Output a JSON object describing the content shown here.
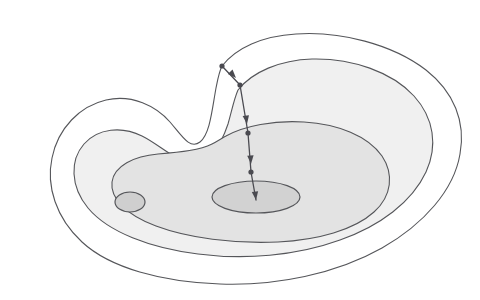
{
  "figure": {
    "name": "contour-descent-diagram",
    "width": 480,
    "height": 300,
    "background": "#ffffff",
    "style": "hand-drawn pencil sketch"
  },
  "colors": {
    "background": "#ffffff",
    "stroke": "#55565a",
    "band_1_fill": "#ffffff",
    "band_2_fill": "#f0f0f0",
    "band_3_fill": "#e3e3e3",
    "band_4_fill": "#d2d2d2",
    "minor_basin_fill": "#cfcfcf",
    "trajectory": "#4a4a50"
  },
  "contours": [
    {
      "name": "contour-level-1-outer",
      "label": "outermost level set",
      "fill": "#ffffff",
      "stroke": "#55565a",
      "stroke_width": 1.1,
      "path": "M 222 66 C 236 48 262 36 296 34 C 340 31 392 44 426 70 C 454 92 466 122 460 154 C 454 190 424 224 382 248 C 336 274 276 286 220 284 C 162 282 110 268 82 242 C 56 218 46 186 52 158 C 58 128 80 106 106 100 C 132 94 156 106 170 122 C 182 136 190 150 200 142 C 210 134 212 110 216 88 C 218 78 219 72 222 66 Z"
    },
    {
      "name": "contour-level-2",
      "label": "second level set",
      "fill": "#f0f0f0",
      "stroke": "#55565a",
      "stroke_width": 1.1,
      "path": "M 238 90 C 252 72 280 60 312 59 C 352 58 392 72 414 96 C 434 118 438 146 426 172 C 412 202 380 226 340 240 C 296 256 244 260 198 254 C 150 248 108 232 88 208 C 70 186 70 160 84 144 C 98 128 122 126 142 136 C 160 145 174 160 190 162 C 208 164 220 148 228 124 C 232 110 234 99 238 90 Z"
    },
    {
      "name": "contour-level-3",
      "label": "third level set",
      "fill": "#e3e3e3",
      "stroke": "#55565a",
      "stroke_width": 1.1,
      "path": "M 226 136 C 244 126 274 120 304 122 C 338 124 368 136 382 156 C 394 174 392 196 374 212 C 354 230 318 240 278 242 C 234 244 188 238 156 226 C 126 215 110 198 112 182 C 114 166 134 156 158 154 C 182 152 200 150 212 144 C 218 141 222 138 226 136 Z"
    },
    {
      "name": "contour-basin-global-minimum",
      "label": "innermost level set around global minimum",
      "fill": "#d2d2d2",
      "stroke": "#55565a",
      "stroke_width": 1.2,
      "shape": "ellipse",
      "cx": 256,
      "cy": 197,
      "rx": 44,
      "ry": 16
    },
    {
      "name": "contour-basin-local-minimum",
      "label": "small secondary basin (local minimum)",
      "fill": "#cfcfcf",
      "stroke": "#55565a",
      "stroke_width": 1.2,
      "shape": "ellipse",
      "cx": 130,
      "cy": 202,
      "rx": 15,
      "ry": 10
    }
  ],
  "trajectory": {
    "name": "gradient-descent-path",
    "label": "descent trajectory",
    "stroke": "#4a4a50",
    "stroke_width": 1.3,
    "start_point": {
      "x": 222,
      "y": 66
    },
    "end_point": {
      "x": 256,
      "y": 200
    },
    "polyline": "222,66 240,85 248,133 251,172 256,200",
    "iterate_dots": [
      {
        "name": "iterate-0",
        "x": 222,
        "y": 66,
        "r": 2.6
      },
      {
        "name": "iterate-1",
        "x": 240,
        "y": 85,
        "r": 2.6
      },
      {
        "name": "iterate-2",
        "x": 248,
        "y": 133,
        "r": 2.6
      },
      {
        "name": "iterate-3",
        "x": 251,
        "y": 172,
        "r": 2.6
      }
    ],
    "arrowheads": [
      {
        "name": "arrowhead-step-1",
        "x": 236,
        "y": 78,
        "angle": 47
      },
      {
        "name": "arrowhead-step-2",
        "x": 247,
        "y": 124,
        "angle": 82
      },
      {
        "name": "arrowhead-step-3",
        "x": 251,
        "y": 164,
        "angle": 86
      },
      {
        "name": "arrowhead-step-4",
        "x": 256,
        "y": 200,
        "angle": 83
      }
    ]
  }
}
